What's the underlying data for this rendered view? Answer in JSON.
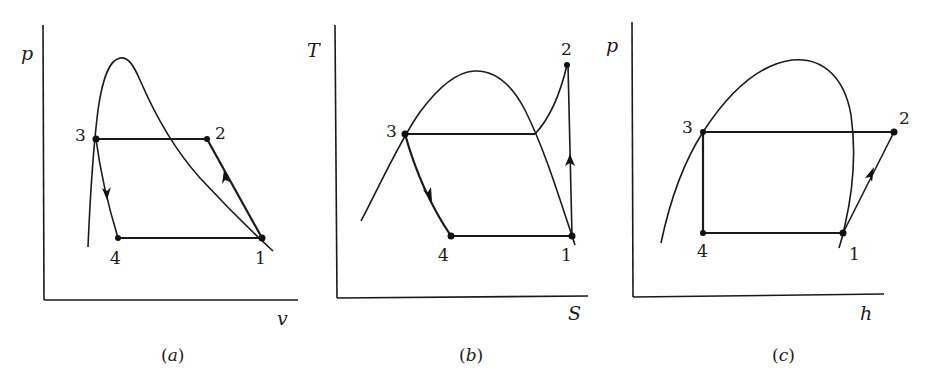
{
  "figure": {
    "panels": [
      {
        "id": "a",
        "caption_open": "(",
        "caption_letter": "a",
        "caption_close": ")",
        "x_axis_label": "v",
        "y_axis_label": "p",
        "points": [
          {
            "label": "1"
          },
          {
            "label": "2"
          },
          {
            "label": "3"
          },
          {
            "label": "4"
          }
        ],
        "description": "p-v diagram of vapor-compression refrigeration cycle with saturation dome"
      },
      {
        "id": "b",
        "caption_open": "(",
        "caption_letter": "b",
        "caption_close": ")",
        "x_axis_label": "S",
        "y_axis_label": "T",
        "points": [
          {
            "label": "1"
          },
          {
            "label": "2"
          },
          {
            "label": "3"
          },
          {
            "label": "4"
          }
        ],
        "description": "T-S diagram of vapor-compression refrigeration cycle with saturation dome"
      },
      {
        "id": "c",
        "caption_open": "(",
        "caption_letter": "c",
        "caption_close": ")",
        "x_axis_label": "h",
        "y_axis_label": "p",
        "points": [
          {
            "label": "1"
          },
          {
            "label": "2"
          },
          {
            "label": "3"
          },
          {
            "label": "4"
          }
        ],
        "description": "p-h diagram of vapor-compression refrigeration cycle with saturation dome"
      }
    ],
    "colors": {
      "ink": "#1a1a1a",
      "background": "#ffffff"
    }
  }
}
